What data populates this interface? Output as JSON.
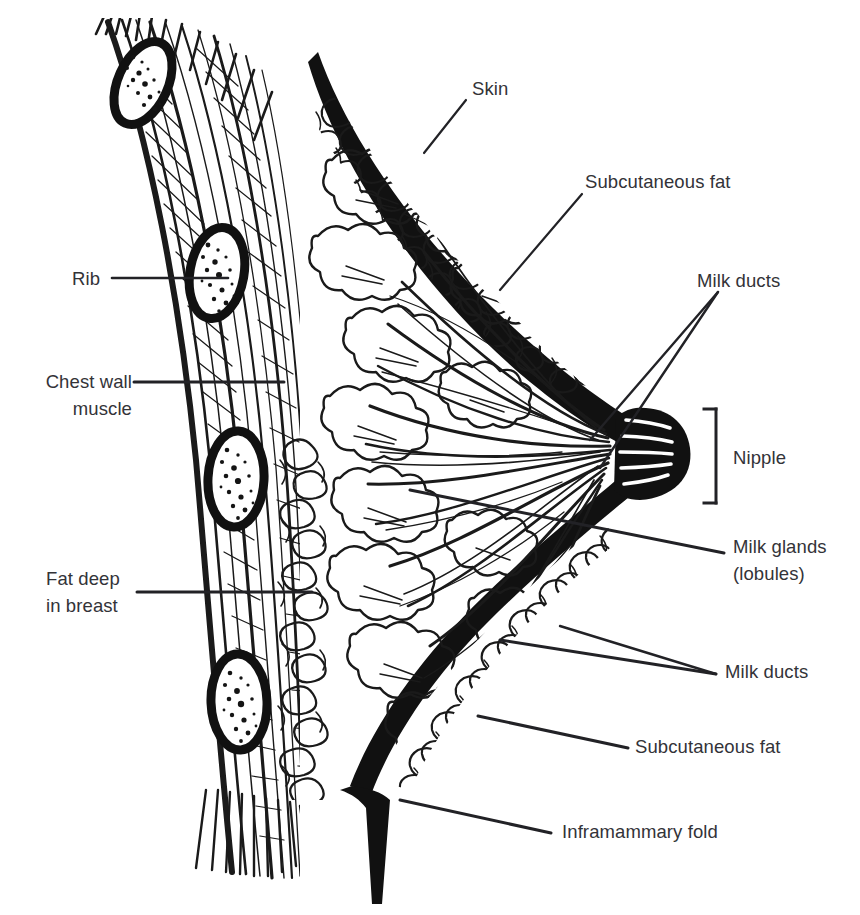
{
  "figure": {
    "type": "anatomical-line-drawing",
    "background_color": "#ffffff",
    "ink_color": "#1a1a1a",
    "text_color": "#333338"
  },
  "labels": [
    {
      "id": "skin",
      "text": "Skin",
      "x": 472,
      "y": 75,
      "align": "left",
      "leader": [
        [
          466,
          100
        ],
        [
          424,
          153
        ]
      ]
    },
    {
      "id": "subcutaneous-fat-top",
      "text": "Subcutaneous fat",
      "x": 585,
      "y": 168,
      "align": "left",
      "leader": [
        [
          582,
          194
        ],
        [
          500,
          290
        ]
      ]
    },
    {
      "id": "milk-ducts-top",
      "text": "Milk ducts",
      "x": 697,
      "y": 267,
      "align": "left",
      "leader": [
        [
          718,
          292
        ],
        [
          590,
          440
        ]
      ]
    },
    {
      "id": "rib",
      "text": "Rib",
      "x": 72,
      "y": 265,
      "align": "left",
      "leader": [
        [
          112,
          278
        ],
        [
          228,
          278
        ]
      ]
    },
    {
      "id": "chest-wall-muscle",
      "text": "Chest wall\nmuscle",
      "x": 22,
      "y": 368,
      "align": "right",
      "leader": [
        [
          134,
          382
        ],
        [
          280,
          382
        ]
      ]
    },
    {
      "id": "nipple",
      "text": "Nipple",
      "x": 733,
      "y": 444,
      "align": "left",
      "bracket": {
        "x": 715,
        "y1": 409,
        "y2": 503,
        "tick": 12
      }
    },
    {
      "id": "milk-glands-lobules",
      "text": "Milk glands\n(lobules)",
      "x": 733,
      "y": 533,
      "align": "left",
      "leader": [
        [
          724,
          553
        ],
        [
          410,
          490
        ]
      ]
    },
    {
      "id": "fat-deep-in-breast",
      "text": "Fat deep\nin breast",
      "x": 46,
      "y": 565,
      "align": "left",
      "leader": [
        [
          137,
          592
        ],
        [
          310,
          592
        ]
      ]
    },
    {
      "id": "milk-ducts-bottom",
      "text": "Milk ducts",
      "x": 725,
      "y": 658,
      "align": "left",
      "leader": [
        [
          716,
          674
        ],
        [
          500,
          640
        ]
      ],
      "leader2": [
        [
          716,
          674
        ],
        [
          556,
          628
        ]
      ]
    },
    {
      "id": "subcutaneous-fat-bottom",
      "text": "Subcutaneous fat",
      "x": 635,
      "y": 733,
      "align": "left",
      "leader": [
        [
          628,
          748
        ],
        [
          480,
          716
        ]
      ]
    },
    {
      "id": "inframammary-fold",
      "text": "Inframammary fold",
      "x": 562,
      "y": 818,
      "align": "left",
      "leader": [
        [
          551,
          833
        ],
        [
          403,
          800
        ]
      ]
    }
  ],
  "structures": [
    {
      "id": "ribs",
      "name": "Rib cross-sections",
      "count": 4,
      "description": "Oval bone cross-sections with thick cortical outline and stippled marrow"
    },
    {
      "id": "chest-wall-muscle",
      "name": "Chest wall muscle",
      "description": "Striated fibre bands running along the chest wall"
    },
    {
      "id": "deep-fat",
      "name": "Fat deep in breast",
      "description": "Bubbly fat lobule texture behind the gland"
    },
    {
      "id": "skin",
      "name": "Skin",
      "description": "Thick black contour outlining the breast"
    },
    {
      "id": "subcutaneous-fat",
      "name": "Subcutaneous fat",
      "description": "Bubbly fat layer just beneath the skin"
    },
    {
      "id": "lobules",
      "name": "Milk glands (lobules)",
      "description": "Cloud-like glandular clusters radiating from the nipple"
    },
    {
      "id": "ducts",
      "name": "Milk ducts",
      "description": "Converging tubular lines running to the nipple"
    },
    {
      "id": "nipple",
      "name": "Nipple",
      "description": "Protruding tip where the ducts converge"
    },
    {
      "id": "inframammary-fold",
      "name": "Inframammary fold",
      "description": "V-shaped crease at the lower breast margin"
    }
  ]
}
